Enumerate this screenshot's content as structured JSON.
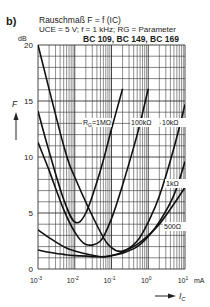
{
  "figure": {
    "panel_label": "b)",
    "title": "Rauschmaß F = f (IC)",
    "conditions": "UCE = 5 V; f = 1 kHz; RG = Parameter",
    "transistors": "BC 109, BC 149, BC 169",
    "y_unit": "dB",
    "y_axis_symbol": "F",
    "x_axis_symbol": "IC",
    "x_unit": "mA"
  },
  "chart_data": {
    "type": "line",
    "title": "Rauschmaß F = f (IC)",
    "subtitle": "UCE = 5 V; f = 1 kHz; RG = Parameter — BC 109, BC 149, BC 169",
    "xlabel": "IC (mA)",
    "ylabel": "F (dB)",
    "xscale": "log",
    "xlim": [
      0.001,
      10
    ],
    "ylim": [
      0,
      20
    ],
    "x_ticks": [
      "10^-3",
      "10^-2",
      "10^-1",
      "10^0",
      "10^1"
    ],
    "y_ticks": [
      0,
      5,
      10,
      15,
      20
    ],
    "grid": true,
    "legend": "inline labels on curves",
    "series": [
      {
        "name": "RG = 1 MΩ",
        "x": [
          0.001,
          0.002,
          0.005,
          0.01,
          0.02,
          0.05,
          0.1,
          0.2
        ],
        "y": [
          14.1,
          10.5,
          6.2,
          4.2,
          5.0,
          8.8,
          12.5,
          16.1
        ]
      },
      {
        "name": "100 kΩ",
        "x": [
          0.001,
          0.002,
          0.005,
          0.01,
          0.02,
          0.05,
          0.1,
          0.2,
          0.5,
          1.0
        ],
        "y": [
          11.3,
          8.8,
          5.3,
          3.3,
          2.2,
          2.5,
          4.5,
          7.5,
          12.0,
          16.1
        ]
      },
      {
        "name": "10 kΩ",
        "x": [
          0.001,
          0.005,
          0.01,
          0.05,
          0.1,
          0.2,
          0.5,
          1.0,
          2.0,
          5.0,
          10.0
        ],
        "y": [
          20,
          11.0,
          8.2,
          3.3,
          1.9,
          1.6,
          2.5,
          4.2,
          6.5,
          10.8,
          14.7
        ]
      },
      {
        "name": "1 kΩ",
        "x": [
          0.001,
          0.002,
          0.005,
          0.01,
          0.05,
          0.1,
          0.2,
          0.5,
          1.0,
          2.0,
          5.0,
          10.0
        ],
        "y": [
          3.5,
          2.8,
          2.0,
          1.6,
          1.1,
          1.2,
          1.4,
          2.0,
          2.9,
          4.2,
          6.6,
          9.6
        ]
      },
      {
        "name": "500 Ω",
        "x": [
          0.001,
          0.002,
          0.005,
          0.01,
          0.05,
          0.1,
          0.2,
          0.5,
          1.0,
          2.0,
          5.0,
          10.0
        ],
        "y": [
          1.7,
          1.5,
          1.3,
          1.2,
          1.1,
          1.2,
          1.5,
          2.2,
          3.0,
          4.0,
          5.8,
          7.3
        ]
      }
    ]
  }
}
